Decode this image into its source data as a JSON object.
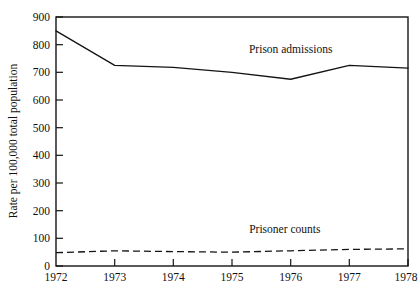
{
  "chart_data": {
    "type": "line",
    "title": "",
    "xlabel": "",
    "ylabel": "Rate per 100,000 total population",
    "categories": [
      "1972",
      "1973",
      "1974",
      "1975",
      "1976",
      "1977",
      "1978"
    ],
    "x": [
      1972,
      1973,
      1974,
      1975,
      1976,
      1977,
      1978
    ],
    "xlim": [
      1972,
      1978
    ],
    "ylim": [
      0,
      900
    ],
    "y_ticks": [
      0,
      100,
      200,
      300,
      400,
      500,
      600,
      700,
      800,
      900
    ],
    "y_tick_labels": [
      "0",
      "100",
      "200",
      "300",
      "400",
      "500",
      "600",
      "700",
      "800",
      "900"
    ],
    "x_ticks": [
      1972,
      1973,
      1974,
      1975,
      1976,
      1977,
      1978
    ],
    "x_tick_labels": [
      "1972",
      "1973",
      "1974",
      "1975",
      "1976",
      "1977",
      "1978"
    ],
    "grid": false,
    "legend_position": "inline-annotations",
    "series": [
      {
        "name": "Prison admissions",
        "style": "solid",
        "values": [
          850,
          725,
          718,
          700,
          675,
          725,
          715
        ]
      },
      {
        "name": "Prisoner counts",
        "style": "dashed",
        "values": [
          48,
          55,
          52,
          50,
          55,
          60,
          62
        ]
      }
    ],
    "annotations": [
      {
        "text": "Prison admissions",
        "x": 1976.0,
        "y": 770
      },
      {
        "text": "Prisoner counts",
        "x": 1975.9,
        "y": 118
      }
    ]
  }
}
